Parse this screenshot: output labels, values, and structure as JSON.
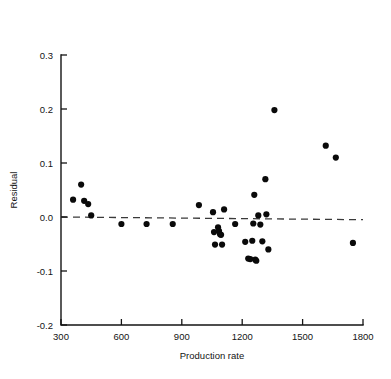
{
  "chart_data": {
    "type": "scatter",
    "title": "",
    "xlabel": "Production rate",
    "ylabel": "Residual",
    "xlim": [
      300,
      1800
    ],
    "ylim": [
      -0.2,
      0.3
    ],
    "xticks": [
      300,
      600,
      900,
      1200,
      1500,
      1800
    ],
    "xtick_labels": [
      "300",
      "600",
      "900",
      "1200",
      "1500",
      "1800"
    ],
    "yticks": [
      -0.2,
      -0.1,
      0.0,
      0.1,
      0.2,
      0.3
    ],
    "ytick_labels": [
      "-0.2",
      "-0.1",
      "0.0",
      "0.1",
      "0.2",
      "0.3"
    ],
    "grid": false,
    "legend": null,
    "marker": "filled-circle",
    "marker_color": "#0a0a0a",
    "marker_size": 3.1,
    "reference_line": {
      "name": "zero-residual-line",
      "style": "dashed",
      "color": "#3a3a3a",
      "y_start": 0.0,
      "y_end": -0.005,
      "x_start": 300,
      "x_end": 1800
    },
    "points": [
      {
        "x": 360,
        "y": 0.032
      },
      {
        "x": 400,
        "y": 0.06
      },
      {
        "x": 415,
        "y": 0.03
      },
      {
        "x": 435,
        "y": 0.024
      },
      {
        "x": 450,
        "y": 0.003
      },
      {
        "x": 600,
        "y": -0.013
      },
      {
        "x": 725,
        "y": -0.013
      },
      {
        "x": 855,
        "y": -0.013
      },
      {
        "x": 985,
        "y": 0.022
      },
      {
        "x": 1055,
        "y": 0.009
      },
      {
        "x": 1060,
        "y": -0.028
      },
      {
        "x": 1065,
        "y": -0.051
      },
      {
        "x": 1080,
        "y": -0.019
      },
      {
        "x": 1085,
        "y": -0.026
      },
      {
        "x": 1090,
        "y": -0.032
      },
      {
        "x": 1095,
        "y": -0.033
      },
      {
        "x": 1100,
        "y": -0.051
      },
      {
        "x": 1110,
        "y": 0.014
      },
      {
        "x": 1165,
        "y": -0.013
      },
      {
        "x": 1215,
        "y": -0.046
      },
      {
        "x": 1230,
        "y": -0.077
      },
      {
        "x": 1240,
        "y": -0.078
      },
      {
        "x": 1250,
        "y": -0.044
      },
      {
        "x": 1255,
        "y": -0.012
      },
      {
        "x": 1260,
        "y": 0.041
      },
      {
        "x": 1265,
        "y": -0.079
      },
      {
        "x": 1270,
        "y": -0.081
      },
      {
        "x": 1280,
        "y": 0.003
      },
      {
        "x": 1290,
        "y": -0.014
      },
      {
        "x": 1300,
        "y": -0.045
      },
      {
        "x": 1315,
        "y": 0.07
      },
      {
        "x": 1320,
        "y": 0.005
      },
      {
        "x": 1330,
        "y": -0.06
      },
      {
        "x": 1360,
        "y": 0.198
      },
      {
        "x": 1615,
        "y": 0.132
      },
      {
        "x": 1665,
        "y": 0.11
      },
      {
        "x": 1750,
        "y": -0.048
      }
    ]
  }
}
